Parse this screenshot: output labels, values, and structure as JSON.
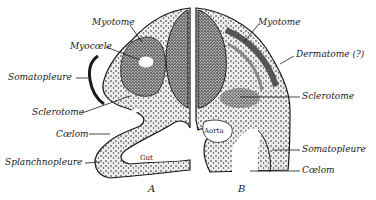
{
  "figure": {
    "panels": [
      {
        "id": "A",
        "label": "A"
      },
      {
        "id": "B",
        "label": "B"
      }
    ],
    "labels_left": {
      "myotome": "Myotome",
      "myocoele": "Myocœle",
      "somatopleure": "Somatopleure",
      "sclerotome": "Sclerotome",
      "coelom": "Cœlom",
      "splanchnopleure": "Splanchnopleure"
    },
    "labels_right": {
      "myotome": "Myotome",
      "dermatome": "Dermatome (?)",
      "sclerotome": "Sclerotome",
      "somatopleure": "Somatopleure",
      "coelom": "Cœlom"
    },
    "inner_labels": {
      "gut": "Gut",
      "aorta": "Aorta"
    },
    "colors": {
      "ink": "#1a1a1a",
      "tissue_fill": "#e6e6e6",
      "background": "#ffffff"
    }
  }
}
